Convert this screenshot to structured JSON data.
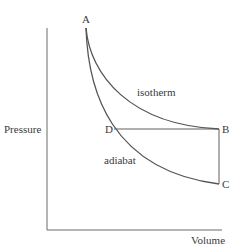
{
  "diagram": {
    "type": "pressure-volume diagram",
    "axes": {
      "y_label": "Pressure",
      "x_label": "Volume"
    },
    "points": {
      "A": "A",
      "B": "B",
      "C": "C",
      "D": "D"
    },
    "curves": {
      "isotherm": "isotherm",
      "adiabat": "adiabat"
    },
    "colors": {
      "line": "#555555",
      "text": "#3a3a3a",
      "background": "#ffffff"
    }
  }
}
